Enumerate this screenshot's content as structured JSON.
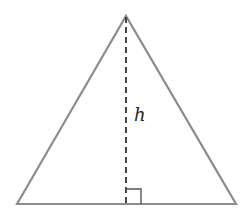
{
  "diagram": {
    "height_label": "h",
    "colors": {
      "outline": "#8c8c8c",
      "dashed": "#333333",
      "text": "#222222",
      "background": "#ffffff"
    }
  }
}
